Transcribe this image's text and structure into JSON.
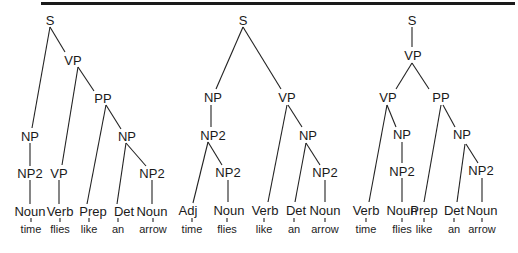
{
  "figure": {
    "trees": [
      {
        "id": "tree1",
        "nodes": [
          {
            "id": "S",
            "label": "S",
            "x": 50,
            "y": 20
          },
          {
            "id": "VP",
            "label": "VP",
            "x": 73,
            "y": 60
          },
          {
            "id": "PP",
            "label": "PP",
            "x": 103,
            "y": 98
          },
          {
            "id": "NP_a",
            "label": "NP",
            "x": 30,
            "y": 136
          },
          {
            "id": "NP_b",
            "label": "NP",
            "x": 127,
            "y": 136
          },
          {
            "id": "NP2_a",
            "label": "NP2",
            "x": 30,
            "y": 173
          },
          {
            "id": "VP_b",
            "label": "VP",
            "x": 59,
            "y": 173
          },
          {
            "id": "NP2_b",
            "label": "NP2",
            "x": 152,
            "y": 173
          },
          {
            "id": "L1",
            "label": "Noun",
            "x": 30,
            "y": 211
          },
          {
            "id": "L2",
            "label": "Verb",
            "x": 60,
            "y": 211
          },
          {
            "id": "L3",
            "label": "Prep",
            "x": 93,
            "y": 211
          },
          {
            "id": "L4",
            "label": "Det",
            "x": 124,
            "y": 211
          },
          {
            "id": "L5",
            "label": "Noun",
            "x": 152,
            "y": 211
          }
        ],
        "edges": [
          [
            "S",
            "VP",
            50,
            27,
            65,
            52
          ],
          [
            "S",
            "NP_a",
            50,
            27,
            32,
            128
          ],
          [
            "VP",
            "PP",
            78,
            67,
            94,
            91
          ],
          [
            "VP",
            "VP_b",
            78,
            67,
            62,
            165
          ],
          [
            "PP",
            "NP_b",
            106,
            105,
            121,
            129
          ],
          [
            "PP",
            "L3",
            106,
            105,
            87,
            204
          ],
          [
            "NP_b",
            "NP2_b",
            126,
            143,
            146,
            166
          ],
          [
            "NP_b",
            "L4",
            126,
            143,
            117,
            204
          ],
          [
            "NP_a",
            "NP2_a",
            30,
            143,
            30,
            166
          ],
          [
            "NP2_a",
            "L1",
            30,
            180,
            30,
            204
          ],
          [
            "VP_b",
            "L2",
            59,
            180,
            59,
            204
          ],
          [
            "NP2_b",
            "L5",
            152,
            180,
            152,
            204
          ]
        ],
        "words": [
          {
            "text": "time",
            "x": 31,
            "y": 229
          },
          {
            "text": "flies",
            "x": 60,
            "y": 229
          },
          {
            "text": "like",
            "x": 89,
            "y": 229
          },
          {
            "text": "an",
            "x": 118,
            "y": 229
          },
          {
            "text": "arrow",
            "x": 153,
            "y": 229
          }
        ]
      },
      {
        "id": "tree2",
        "nodes": [
          {
            "id": "S",
            "label": "S",
            "x": 243,
            "y": 20
          },
          {
            "id": "NP",
            "label": "NP",
            "x": 213,
            "y": 97
          },
          {
            "id": "VP",
            "label": "VP",
            "x": 287,
            "y": 97
          },
          {
            "id": "NP2_a",
            "label": "NP2",
            "x": 213,
            "y": 135
          },
          {
            "id": "NP_b",
            "label": "NP",
            "x": 308,
            "y": 135
          },
          {
            "id": "NP2_c",
            "label": "NP2",
            "x": 228,
            "y": 172
          },
          {
            "id": "NP2_d",
            "label": "NP2",
            "x": 325,
            "y": 172
          },
          {
            "id": "L1",
            "label": "Adj",
            "x": 188,
            "y": 210
          },
          {
            "id": "L2",
            "label": "Noun",
            "x": 229,
            "y": 210
          },
          {
            "id": "L3",
            "label": "Verb",
            "x": 265,
            "y": 210
          },
          {
            "id": "L4",
            "label": "Det",
            "x": 296,
            "y": 210
          },
          {
            "id": "L5",
            "label": "Noun",
            "x": 325,
            "y": 210
          }
        ],
        "edges": [
          [
            "S",
            "NP",
            243,
            27,
            216,
            89
          ],
          [
            "S",
            "VP",
            243,
            27,
            281,
            89
          ],
          [
            "NP",
            "NP2_a",
            211,
            105,
            211,
            127
          ],
          [
            "NP2_a",
            "L1",
            208,
            142,
            193,
            203
          ],
          [
            "NP2_a",
            "NP2_c",
            208,
            142,
            222,
            165
          ],
          [
            "NP2_c",
            "L2",
            228,
            180,
            228,
            202
          ],
          [
            "VP",
            "L3",
            287,
            105,
            268,
            202
          ],
          [
            "VP",
            "NP_b",
            288,
            105,
            302,
            127
          ],
          [
            "NP_b",
            "L4",
            306,
            143,
            295,
            202
          ],
          [
            "NP_b",
            "NP2_d",
            306,
            143,
            320,
            165
          ],
          [
            "NP2_d",
            "L5",
            325,
            180,
            325,
            202
          ]
        ],
        "words": [
          {
            "text": "time",
            "x": 192,
            "y": 229
          },
          {
            "text": "flies",
            "x": 227,
            "y": 229
          },
          {
            "text": "like",
            "x": 264,
            "y": 229
          },
          {
            "text": "an",
            "x": 294,
            "y": 229
          },
          {
            "text": "arrow",
            "x": 325,
            "y": 229
          }
        ]
      },
      {
        "id": "tree3",
        "nodes": [
          {
            "id": "S",
            "label": "S",
            "x": 412,
            "y": 20
          },
          {
            "id": "VP",
            "label": "VP",
            "x": 413,
            "y": 55
          },
          {
            "id": "VP_a",
            "label": "VP",
            "x": 388,
            "y": 97
          },
          {
            "id": "PP",
            "label": "PP",
            "x": 441,
            "y": 97
          },
          {
            "id": "NP_a",
            "label": "NP",
            "x": 402,
            "y": 134
          },
          {
            "id": "NP_b",
            "label": "NP",
            "x": 462,
            "y": 134
          },
          {
            "id": "NP2_a",
            "label": "NP2",
            "x": 402,
            "y": 171
          },
          {
            "id": "NP2_b",
            "label": "NP2",
            "x": 481,
            "y": 170
          },
          {
            "id": "L1",
            "label": "Verb",
            "x": 366,
            "y": 210
          },
          {
            "id": "L2",
            "label": "Noun",
            "x": 402,
            "y": 210
          },
          {
            "id": "L3",
            "label": "Prep",
            "x": 424,
            "y": 210
          },
          {
            "id": "L4",
            "label": "Det",
            "x": 454,
            "y": 210
          },
          {
            "id": "L5",
            "label": "Noun",
            "x": 482,
            "y": 210
          }
        ],
        "edges": [
          [
            "S",
            "VP",
            412,
            27,
            412,
            47
          ],
          [
            "VP",
            "VP_a",
            412,
            63,
            396,
            89
          ],
          [
            "VP",
            "PP",
            412,
            63,
            429,
            89
          ],
          [
            "VP_a",
            "L1",
            387,
            105,
            369,
            202
          ],
          [
            "VP_a",
            "NP_a",
            387,
            105,
            396,
            127
          ],
          [
            "NP_a",
            "NP2_a",
            402,
            142,
            402,
            163
          ],
          [
            "NP2_a",
            "L2",
            402,
            178,
            402,
            202
          ],
          [
            "PP",
            "L3",
            441,
            105,
            424,
            202
          ],
          [
            "PP",
            "NP_b",
            443,
            105,
            455,
            127
          ],
          [
            "NP_b",
            "L4",
            465,
            144,
            457,
            202
          ],
          [
            "NP_b",
            "NP2_b",
            466,
            144,
            478,
            163
          ],
          [
            "NP2_b",
            "L5",
            482,
            178,
            482,
            202
          ]
        ],
        "words": [
          {
            "text": "time",
            "x": 366,
            "y": 229
          },
          {
            "text": "flies",
            "x": 402,
            "y": 229
          },
          {
            "text": "like",
            "x": 424,
            "y": 229
          },
          {
            "text": "an",
            "x": 454,
            "y": 229
          },
          {
            "text": "arrow",
            "x": 482,
            "y": 229
          }
        ]
      }
    ]
  }
}
